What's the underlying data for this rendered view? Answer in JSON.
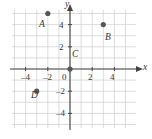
{
  "figure": {
    "type": "coordinate-plane",
    "width": 152,
    "height": 139,
    "background_color": "#ffffff",
    "grid_color": "#cfcfcf",
    "axis_color": "#444444",
    "point_color": "#555555",
    "label_color": "#3a3a3a"
  },
  "axes": {
    "x_name": "x",
    "y_name": "y",
    "origin_label": "0",
    "x_ticks": [
      {
        "value": -4,
        "label": "–4"
      },
      {
        "value": -2,
        "label": "–2"
      },
      {
        "value": 2,
        "label": "2"
      },
      {
        "value": 4,
        "label": "4"
      }
    ],
    "y_ticks": [
      {
        "value": 4,
        "label": "4"
      },
      {
        "value": 2,
        "label": "2"
      },
      {
        "value": -2,
        "label": "–2"
      },
      {
        "value": -4,
        "label": "–4"
      }
    ]
  },
  "chart_data": {
    "type": "scatter",
    "title": "",
    "xlabel": "x",
    "ylabel": "y",
    "xlim": [
      -5.3,
      6
    ],
    "ylim": [
      -5.3,
      5.5
    ],
    "grid": true,
    "legend": "none",
    "points": [
      {
        "name": "A",
        "x": -2,
        "y": 5,
        "label": "A"
      },
      {
        "name": "B",
        "x": 3,
        "y": 4,
        "label": "B"
      },
      {
        "name": "C",
        "x": 0,
        "y": 0,
        "label": "C"
      },
      {
        "name": "D",
        "x": -3,
        "y": -2,
        "label": "D"
      }
    ]
  }
}
